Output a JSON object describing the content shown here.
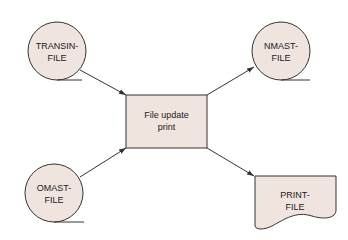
{
  "diagram": {
    "type": "system-flowchart",
    "colors": {
      "fill": "#efe4de",
      "stroke": "#333333",
      "text": "#222222"
    },
    "nodes": [
      {
        "id": "transin",
        "shape": "tape",
        "line1": "TRANSIN-",
        "line2": "FILE"
      },
      {
        "id": "omast",
        "shape": "tape",
        "line1": "OMAST-",
        "line2": "FILE"
      },
      {
        "id": "process",
        "shape": "process",
        "line1": "File update",
        "line2": "print"
      },
      {
        "id": "nmast",
        "shape": "tape",
        "line1": "NMAST-",
        "line2": "FILE"
      },
      {
        "id": "print",
        "shape": "document",
        "line1": "PRINT-",
        "line2": "FILE"
      }
    ],
    "edges": [
      {
        "from": "transin",
        "to": "process"
      },
      {
        "from": "omast",
        "to": "process"
      },
      {
        "from": "process",
        "to": "nmast"
      },
      {
        "from": "process",
        "to": "print"
      }
    ]
  }
}
